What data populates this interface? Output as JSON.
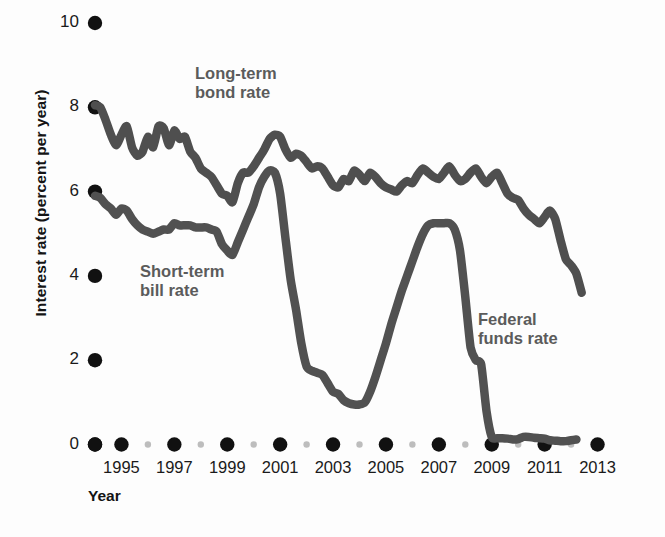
{
  "chart_data": {
    "type": "line",
    "title": "",
    "xlabel": "Year",
    "ylabel": "Interest rate (percent per year)",
    "xlim": [
      1993.4,
      2013.6
    ],
    "ylim": [
      0,
      10
    ],
    "grid": false,
    "legend_position": "inline-annotations",
    "y_ticks": [
      0,
      2,
      4,
      6,
      8,
      10
    ],
    "y_tick_labels": [
      "0",
      "2",
      "4",
      "6",
      "8",
      "10"
    ],
    "x_ticks": [
      1994,
      1995,
      1996,
      1997,
      1998,
      1999,
      2000,
      2001,
      2002,
      2003,
      2004,
      2005,
      2006,
      2007,
      2008,
      2009,
      2010,
      2011,
      2012,
      2013
    ],
    "x_tick_labels_major": [
      "1995",
      "1997",
      "1999",
      "2001",
      "2003",
      "2005",
      "2007",
      "2009",
      "2011",
      "2013"
    ],
    "x_major_years": [
      1995,
      1997,
      1999,
      2001,
      2003,
      2005,
      2007,
      2009,
      2011,
      2013
    ],
    "x_minor_years": [
      1996,
      1998,
      2000,
      2002,
      2004,
      2006,
      2008,
      2010,
      2012
    ],
    "annotations": [
      {
        "name": "long-term-bond-rate",
        "text": "Long-term\nbond rate"
      },
      {
        "name": "short-term-bill-rate",
        "text": "Short-term\nbill rate"
      },
      {
        "name": "federal-funds-rate",
        "text": "Federal\nfunds rate"
      }
    ],
    "series": [
      {
        "name": "Long-term bond rate",
        "color": "#4f4f4f",
        "x": [
          1994.0,
          1994.2,
          1994.4,
          1994.6,
          1994.8,
          1995.0,
          1995.2,
          1995.4,
          1995.6,
          1995.8,
          1996.0,
          1996.2,
          1996.4,
          1996.6,
          1996.8,
          1997.0,
          1997.2,
          1997.4,
          1997.6,
          1997.8,
          1998.0,
          1998.2,
          1998.4,
          1998.6,
          1998.8,
          1999.0,
          1999.2,
          1999.4,
          1999.6,
          1999.8,
          2000.0,
          2000.2,
          2000.4,
          2000.6,
          2000.8,
          2001.0,
          2001.2,
          2001.4,
          2001.6,
          2001.8,
          2002.0,
          2002.2,
          2002.4,
          2002.6,
          2002.8,
          2003.0,
          2003.2,
          2003.4,
          2003.6,
          2003.8,
          2004.0,
          2004.2,
          2004.4,
          2004.6,
          2004.8,
          2005.0,
          2005.2,
          2005.4,
          2005.6,
          2005.8,
          2006.0,
          2006.2,
          2006.4,
          2006.6,
          2006.8,
          2007.0,
          2007.2,
          2007.4,
          2007.6,
          2007.8,
          2008.0,
          2008.2,
          2008.4,
          2008.6,
          2008.8,
          2009.0,
          2009.2,
          2009.4,
          2009.6,
          2009.8,
          2010.0,
          2010.2,
          2010.4,
          2010.6,
          2010.8,
          2011.0,
          2011.2,
          2011.4,
          2011.6,
          2011.8,
          2012.0,
          2012.2,
          2012.4
        ],
        "y": [
          8.05,
          8.0,
          7.7,
          7.35,
          7.1,
          7.35,
          7.55,
          7.05,
          6.85,
          6.95,
          7.3,
          7.05,
          7.55,
          7.5,
          7.1,
          7.45,
          7.25,
          7.3,
          6.95,
          6.8,
          6.55,
          6.45,
          6.35,
          6.15,
          5.95,
          5.9,
          5.75,
          6.2,
          6.45,
          6.45,
          6.6,
          6.8,
          7.0,
          7.25,
          7.35,
          7.3,
          7.0,
          6.8,
          6.9,
          6.85,
          6.7,
          6.55,
          6.6,
          6.55,
          6.35,
          6.15,
          6.1,
          6.3,
          6.25,
          6.5,
          6.4,
          6.25,
          6.45,
          6.35,
          6.2,
          6.1,
          6.05,
          6.0,
          6.15,
          6.25,
          6.2,
          6.4,
          6.55,
          6.45,
          6.35,
          6.3,
          6.45,
          6.6,
          6.4,
          6.25,
          6.3,
          6.45,
          6.55,
          6.35,
          6.2,
          6.35,
          6.45,
          6.2,
          5.95,
          5.85,
          5.8,
          5.6,
          5.45,
          5.35,
          5.25,
          5.4,
          5.55,
          5.35,
          4.85,
          4.4,
          4.25,
          4.05,
          3.6
        ]
      },
      {
        "name": "Short-term bill rate / Federal funds rate",
        "color": "#515151",
        "x": [
          1994.0,
          1994.2,
          1994.4,
          1994.6,
          1994.8,
          1995.0,
          1995.2,
          1995.4,
          1995.6,
          1995.8,
          1996.0,
          1996.2,
          1996.4,
          1996.6,
          1996.8,
          1997.0,
          1997.2,
          1997.4,
          1997.6,
          1997.8,
          1998.0,
          1998.2,
          1998.4,
          1998.6,
          1998.8,
          1999.0,
          1999.2,
          1999.4,
          1999.6,
          1999.8,
          2000.0,
          2000.2,
          2000.4,
          2000.6,
          2000.8,
          2001.0,
          2001.2,
          2001.4,
          2001.6,
          2001.8,
          2002.0,
          2002.2,
          2002.4,
          2002.6,
          2002.8,
          2003.0,
          2003.2,
          2003.4,
          2003.6,
          2003.8,
          2004.0,
          2004.2,
          2004.4,
          2004.6,
          2004.8,
          2005.0,
          2005.2,
          2005.4,
          2005.6,
          2005.8,
          2006.0,
          2006.2,
          2006.4,
          2006.6,
          2006.8,
          2007.0,
          2007.2,
          2007.4,
          2007.6,
          2007.8,
          2008.0,
          2008.2,
          2008.4,
          2008.6,
          2008.8,
          2009.0,
          2009.2,
          2009.4,
          2009.6,
          2009.8,
          2010.0,
          2010.2,
          2010.4,
          2010.6,
          2010.8,
          2011.0,
          2011.2,
          2011.4,
          2011.6,
          2011.8,
          2012.0,
          2012.2
        ],
        "y": [
          5.9,
          5.85,
          5.7,
          5.6,
          5.45,
          5.6,
          5.55,
          5.35,
          5.2,
          5.1,
          5.05,
          5.0,
          5.05,
          5.1,
          5.1,
          5.25,
          5.2,
          5.2,
          5.2,
          5.15,
          5.15,
          5.15,
          5.1,
          5.05,
          4.75,
          4.6,
          4.5,
          4.8,
          5.1,
          5.4,
          5.7,
          6.1,
          6.35,
          6.5,
          6.45,
          5.95,
          4.9,
          3.9,
          3.2,
          2.4,
          1.85,
          1.75,
          1.7,
          1.65,
          1.45,
          1.25,
          1.2,
          1.05,
          0.98,
          0.95,
          0.95,
          1.0,
          1.25,
          1.6,
          2.0,
          2.4,
          2.85,
          3.25,
          3.65,
          4.0,
          4.35,
          4.7,
          5.0,
          5.2,
          5.25,
          5.25,
          5.25,
          5.25,
          5.1,
          4.6,
          3.5,
          2.3,
          2.0,
          1.9,
          0.8,
          0.18,
          0.15,
          0.15,
          0.14,
          0.12,
          0.13,
          0.18,
          0.18,
          0.16,
          0.15,
          0.14,
          0.1,
          0.09,
          0.08,
          0.08,
          0.1,
          0.12
        ]
      }
    ]
  },
  "axis": {
    "y_title": "Interest rate (percent per year)",
    "x_title": "Year"
  }
}
